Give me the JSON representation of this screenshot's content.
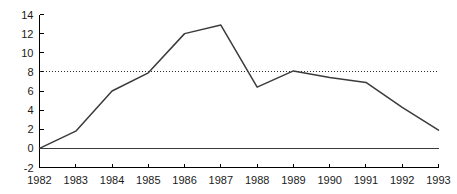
{
  "chart_data": {
    "type": "line",
    "title": "",
    "subtitle": "",
    "xlabel": "",
    "ylabel": "",
    "x": [
      1982,
      1983,
      1984,
      1985,
      1986,
      1987,
      1988,
      1989,
      1990,
      1991,
      1992,
      1993
    ],
    "categories": [
      "1982",
      "1983",
      "1984",
      "1985",
      "1986",
      "1987",
      "1988",
      "1989",
      "1990",
      "1991",
      "1992",
      "1993"
    ],
    "series": [
      {
        "name": "series-1",
        "values": [
          0,
          1.8,
          6.0,
          7.9,
          12.0,
          12.9,
          6.4,
          8.1,
          7.4,
          6.9,
          4.3,
          1.9
        ],
        "color": "#3b3b3b"
      }
    ],
    "reference_lines": [
      {
        "name": "dotted-reference",
        "orientation": "horizontal",
        "value": 8,
        "style": "dotted",
        "color": "#2b2b2b"
      },
      {
        "name": "zero-baseline",
        "orientation": "horizontal",
        "value": 0,
        "style": "solid",
        "color": "#3a3a3a"
      }
    ],
    "xlim": [
      1982,
      1993
    ],
    "ylim": [
      -2,
      14
    ],
    "yticks": [
      -2,
      0,
      2,
      4,
      6,
      8,
      10,
      12,
      14
    ],
    "ytick_labels": [
      "-2",
      "0",
      "2",
      "4",
      "6",
      "8",
      "10",
      "12",
      "14"
    ],
    "xticks": [
      1982,
      1983,
      1984,
      1985,
      1986,
      1987,
      1988,
      1989,
      1990,
      1991,
      1992,
      1993
    ],
    "xtick_labels": [
      "1982",
      "1983",
      "1984",
      "1985",
      "1986",
      "1987",
      "1988",
      "1989",
      "1990",
      "1991",
      "1992",
      "1993"
    ],
    "grid": false,
    "legend": null,
    "legend_position": "none",
    "annotations": []
  },
  "colors": {
    "background": "#ffffff",
    "axis": "#000000",
    "data_line": "#3b3b3b",
    "reference_line": "#2b2b2b",
    "zero_line": "#3a3a3a",
    "tick_text": "#1a1a1a"
  }
}
